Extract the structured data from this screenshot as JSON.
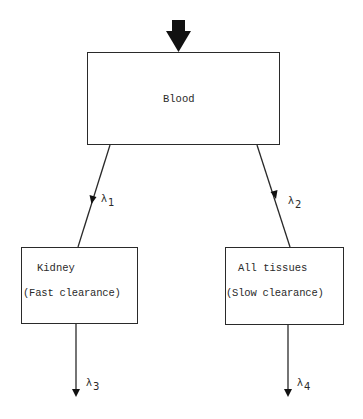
{
  "diagram": {
    "type": "compartment-model",
    "input_arrow": {
      "label": "",
      "direction": "down",
      "target": "blood"
    },
    "compartments": {
      "blood": {
        "title": "Blood"
      },
      "kidney": {
        "title": "Kidney",
        "subtitle": "(Fast clearance)"
      },
      "tissues": {
        "title": "All tissues",
        "subtitle": "(Slow clearance)"
      }
    },
    "rates": {
      "lambda1": {
        "symbol": "λ",
        "index": "1",
        "from": "blood",
        "to": "kidney"
      },
      "lambda2": {
        "symbol": "λ",
        "index": "2",
        "from": "blood",
        "to": "tissues"
      },
      "lambda3": {
        "symbol": "λ",
        "index": "3",
        "from": "kidney",
        "to": "out"
      },
      "lambda4": {
        "symbol": "λ",
        "index": "4",
        "from": "tissues",
        "to": "out"
      }
    },
    "colors": {
      "stroke": "#2a2a2a",
      "background": "#ffffff"
    }
  }
}
